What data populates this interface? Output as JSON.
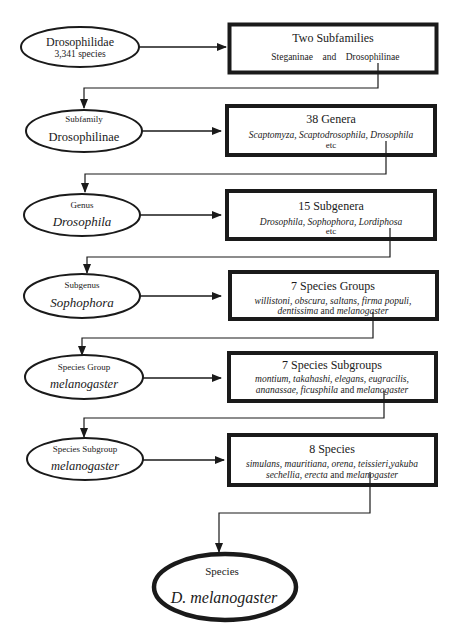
{
  "diagram": {
    "levels": [
      {
        "node": {
          "label": "Drosophilidae",
          "sublabel": "3,341 species"
        },
        "box": {
          "title": "Two Subfamilies",
          "lines": [
            [
              {
                "t": "Steganinae",
                "i": false
              },
              {
                "t": "    and    ",
                "i": false
              },
              {
                "t": "Drosophilinae",
                "i": false
              }
            ]
          ]
        }
      },
      {
        "node": {
          "rank": "Subfamily",
          "name": "Drosophilinae",
          "name_italic": false
        },
        "box": {
          "title": "38 Genera",
          "lines": [
            [
              {
                "t": "Scaptomyza, Scaptodrosophila, Drosophila",
                "i": true
              }
            ],
            [
              {
                "t": "etc",
                "i": false
              }
            ]
          ]
        }
      },
      {
        "node": {
          "rank": "Genus",
          "name": "Drosophila",
          "name_italic": true
        },
        "box": {
          "title": "15 Subgenera",
          "lines": [
            [
              {
                "t": "Drosophila, Sophophora, Lordiphosa",
                "i": true
              }
            ],
            [
              {
                "t": "etc",
                "i": false
              }
            ]
          ]
        }
      },
      {
        "node": {
          "rank": "Subgenus",
          "name": "Sophophora",
          "name_italic": true
        },
        "box": {
          "title": "7 Species Groups",
          "lines": [
            [
              {
                "t": "willistoni, obscura, saltans, firma populi,",
                "i": true
              }
            ],
            [
              {
                "t": "dentissima",
                "i": true
              },
              {
                "t": " and ",
                "i": false
              },
              {
                "t": "melanogaster",
                "i": true
              }
            ]
          ]
        }
      },
      {
        "node": {
          "rank": "Species Group",
          "name": "melanogaster",
          "name_italic": true
        },
        "box": {
          "title": "7 Species Subgroups",
          "lines": [
            [
              {
                "t": "montium, takahashi, elegans, eugracilis,",
                "i": true
              }
            ],
            [
              {
                "t": "ananassae, ficusphila",
                "i": true
              },
              {
                "t": " and ",
                "i": false
              },
              {
                "t": "melanogaster",
                "i": true
              }
            ]
          ]
        }
      },
      {
        "node": {
          "rank": "Species Subgroup",
          "name": "melanogaster",
          "name_italic": true
        },
        "box": {
          "title": "8 Species",
          "lines": [
            [
              {
                "t": "simulans, mauritiana, orena, teissieri,yakuba",
                "i": true
              }
            ],
            [
              {
                "t": "sechellia, erecta",
                "i": true
              },
              {
                "t": " and ",
                "i": false
              },
              {
                "t": "melanogaster",
                "i": true
              }
            ]
          ]
        }
      }
    ],
    "final": {
      "rank": "Species",
      "name": "D. melanogaster"
    }
  },
  "colors": {
    "ink": "#1a1a1a",
    "background": "#ffffff"
  }
}
